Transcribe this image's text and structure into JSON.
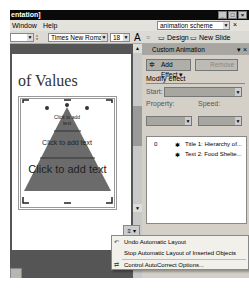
{
  "window": {
    "title": "entation]",
    "controls": [
      "_",
      "□",
      "×"
    ]
  },
  "menubar": {
    "items": [
      "Window",
      "Help"
    ],
    "search_value": "animation scheme",
    "close_label": "×"
  },
  "toolbar": {
    "font_name": "Times New Roman",
    "font_size": "18",
    "grow_font_icon": "A",
    "design_label": "Design",
    "new_slide_label": "New Slide"
  },
  "slide": {
    "title_text": "of Values",
    "pyramid": {
      "fill_color": "#6b6b6b",
      "levels": [
        {
          "text": "Click to add text",
          "size": "small"
        },
        {
          "text": "Click to add text",
          "size": "medium"
        },
        {
          "text": "Click to add text",
          "size": "large"
        }
      ]
    },
    "autofit_button_icon": "≡"
  },
  "task_pane": {
    "title": "Custom Animation",
    "add_effect_label": "Add Effect",
    "remove_label": "Remove",
    "modify_effect_label": "Modify effect",
    "start_label": "Start:",
    "property_label": "Property:",
    "speed_label": "Speed:",
    "animation_list": [
      {
        "order": "0",
        "label": "Title 1: Hierarchy of..."
      },
      {
        "order": "",
        "label": "Text 2: Food Shelte..."
      }
    ]
  },
  "context_menu": {
    "items": [
      {
        "label": "Undo Automatic Layout",
        "icon": "undo-icon"
      },
      {
        "label": "Stop Automatic Layout of Inserted Objects",
        "icon": ""
      },
      {
        "label": "Control AutoCorrect Options...",
        "icon": "autocorrect-icon"
      }
    ]
  }
}
